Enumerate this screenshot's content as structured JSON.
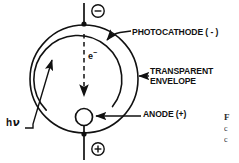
{
  "figure": {
    "width": 239,
    "height": 163,
    "background_color": "#ffffff",
    "ink_color": "#111111"
  },
  "labels": {
    "photocathode": "PHOTOCATHODE ( - )",
    "transparent_envelope_line1": "TRANSPARENT",
    "transparent_envelope_line2": "ENVELOPE",
    "anode": "ANODE (+)",
    "photon": "h",
    "photon_symbol": "ν",
    "electron": "e",
    "electron_charge": "−"
  },
  "terminals": {
    "negative_symbol": "−",
    "positive_symbol": "+",
    "negative_name": "cathode-terminal",
    "positive_name": "anode-terminal"
  },
  "geometry": {
    "envelope_center_x": 84,
    "envelope_center_y": 79,
    "envelope_radius": 54,
    "photocathode_radius": 44,
    "anode_circle_x": 84,
    "anode_circle_y": 117,
    "anode_circle_radius": 8.5
  },
  "caption": {
    "fragment_title": "F",
    "fragment_line1": "c",
    "fragment_line2": "c"
  }
}
